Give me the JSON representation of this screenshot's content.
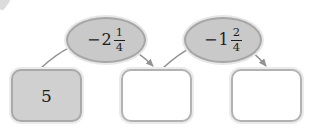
{
  "diagram": {
    "start_box": {
      "value": "5"
    },
    "answer_boxes": [
      {
        "value": ""
      },
      {
        "value": ""
      }
    ],
    "operations": [
      {
        "sign": "−",
        "whole": "2",
        "numerator": "1",
        "denominator": "4",
        "label": "minus 2 and 1/4"
      },
      {
        "sign": "−",
        "whole": "1",
        "numerator": "2",
        "denominator": "4",
        "label": "minus 1 and 2/4"
      }
    ]
  },
  "colors": {
    "oval_fill": "#c9c9c9",
    "oval_border": "#a6a6a6",
    "filled_box_fill": "#d0d0d0",
    "box_border": "#b2b2b2",
    "arrow": "#939393",
    "text": "#1c1c1c"
  }
}
